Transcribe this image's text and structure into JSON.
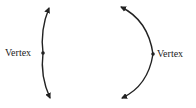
{
  "diagram": {
    "curves": [
      {
        "name": "narrow-parabola",
        "label": "Vertex",
        "vertex": [
          43,
          53
        ]
      },
      {
        "name": "wide-parabola",
        "label": "Vertex",
        "vertex": [
          153,
          54
        ]
      }
    ]
  }
}
